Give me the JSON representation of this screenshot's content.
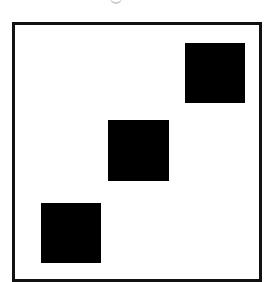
{
  "diagram": {
    "frame": {
      "left": 12,
      "top": 22,
      "width": 250,
      "height": 260,
      "border_color": "#111111"
    },
    "squares": [
      {
        "label": "square-top-right",
        "left": 185,
        "top": 43,
        "size": 60,
        "color": "#000000"
      },
      {
        "label": "square-middle",
        "left": 108,
        "top": 120,
        "size": 61,
        "color": "#000000"
      },
      {
        "label": "square-bottom-left",
        "left": 41,
        "top": 203,
        "size": 60,
        "color": "#000000"
      }
    ]
  }
}
